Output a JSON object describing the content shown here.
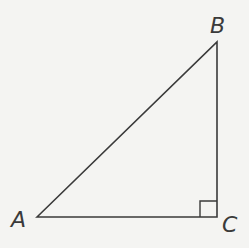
{
  "diagram": {
    "type": "right-triangle",
    "vertices": {
      "A": {
        "label": "A",
        "x": 37,
        "y": 217
      },
      "B": {
        "label": "B",
        "x": 217,
        "y": 42
      },
      "C": {
        "label": "C",
        "x": 217,
        "y": 217
      }
    },
    "right_angle_at": "C",
    "colors": {
      "stroke": "#3a3a3a",
      "background": "#f4f4f2"
    }
  }
}
